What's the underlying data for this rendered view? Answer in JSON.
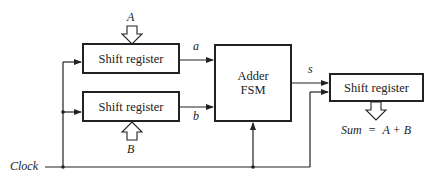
{
  "diagram": {
    "blocks": {
      "shift_register_a": "Shift register",
      "shift_register_b": "Shift register",
      "adder_line1": "Adder",
      "adder_line2": "FSM",
      "shift_register_sum": "Shift register"
    },
    "inputs": {
      "A": "A",
      "B": "B"
    },
    "signals": {
      "a": "a",
      "b": "b",
      "s": "s",
      "clock": "Clock"
    },
    "output": {
      "sum": "Sum",
      "equals": "=",
      "expr": "A + B"
    }
  }
}
